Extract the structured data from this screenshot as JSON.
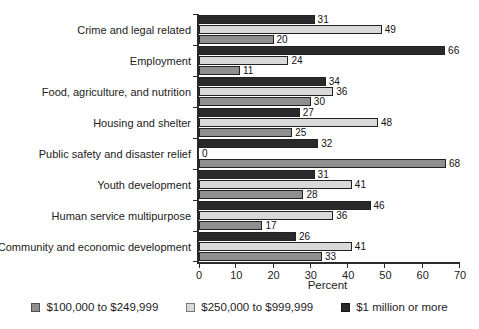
{
  "chart_data": {
    "type": "bar",
    "orientation": "horizontal",
    "xlabel": "Percent",
    "xlim": [
      0,
      70
    ],
    "xticks": [
      0,
      10,
      20,
      30,
      40,
      50,
      60,
      70
    ],
    "grid": false,
    "legend_position": "bottom",
    "categories": [
      "Crime and legal related",
      "Employment",
      "Food, agriculture, and nutrition",
      "Housing and shelter",
      "Public safety and disaster relief",
      "Youth development",
      "Human service multipurpose",
      "Community and economic development"
    ],
    "series": [
      {
        "name": "$1 million or more",
        "color": "#2a2a2a",
        "values": [
          31,
          66,
          34,
          27,
          32,
          31,
          46,
          26
        ]
      },
      {
        "name": "$250,000 to $999,999",
        "color": "#d9d9d9",
        "values": [
          49,
          24,
          36,
          48,
          0,
          41,
          36,
          41
        ]
      },
      {
        "name": "$100,000 to $249,999",
        "color": "#8f8f8f",
        "values": [
          20,
          11,
          30,
          25,
          68,
          28,
          17,
          33
        ]
      }
    ],
    "legend": [
      {
        "label": "$100,000 to $249,999",
        "color": "#8f8f8f"
      },
      {
        "label": "$250,000 to $999,999",
        "color": "#d9d9d9"
      },
      {
        "label": "$1 million or more",
        "color": "#2a2a2a"
      }
    ]
  }
}
